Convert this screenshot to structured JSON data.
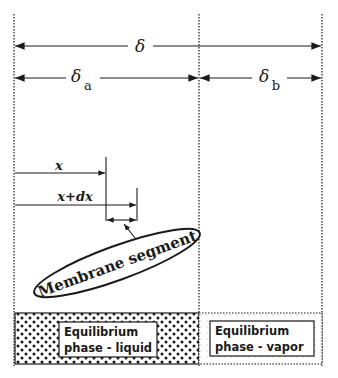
{
  "labels": {
    "delta": "δ",
    "delta_a_symbol": "δ",
    "delta_a_sub": "a",
    "delta_b_symbol": "δ",
    "delta_b_sub": "b",
    "x": "x",
    "x_plus_dx": "x+dx",
    "membrane_segment": "Membrane segment"
  },
  "regions": [
    {
      "line1": "Equilibrium",
      "line2": "phase - liquid",
      "fill": "dotted-dense"
    },
    {
      "line1": "Equilibrium",
      "line2": "phase - vapor",
      "fill": "dotted-light"
    }
  ],
  "colors": {
    "ink": "#1a1a1a",
    "background": "#ffffff"
  }
}
